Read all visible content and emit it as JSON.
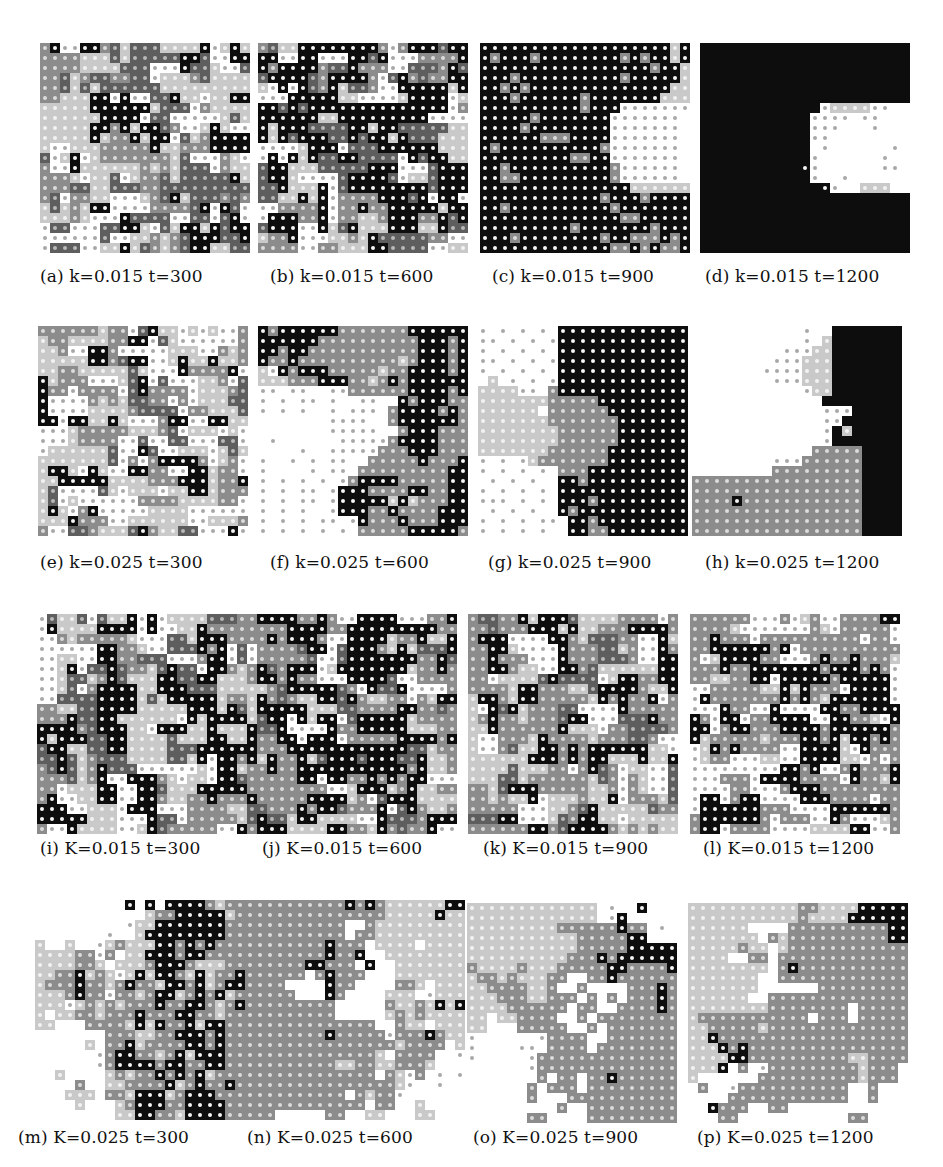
{
  "figure": {
    "cell_size": 10,
    "panels": [
      {
        "id": "a",
        "caption": "(a) k=0.015 t=300",
        "x": 40,
        "y": 43,
        "cols": 21,
        "rows": 21,
        "cap_x": 40,
        "cap_y": 266,
        "seed": 11,
        "mix": "KMDLLo"
      },
      {
        "id": "b",
        "caption": "(b) k=0.015 t=600",
        "x": 258,
        "y": 43,
        "cols": 21,
        "rows": 21,
        "cap_x": 270,
        "cap_y": 266,
        "seed": 23,
        "mix": "KKMDLo"
      },
      {
        "id": "c",
        "caption": "(c) k=0.015 t=900",
        "x": 480,
        "y": 43,
        "cols": 21,
        "rows": 21,
        "cap_x": 492,
        "cap_y": 266,
        "pattern": "c"
      },
      {
        "id": "d",
        "caption": "(d) k=0.015 t=1200",
        "x": 700,
        "y": 43,
        "cols": 21,
        "rows": 21,
        "cap_x": 705,
        "cap_y": 266,
        "pattern": "d"
      },
      {
        "id": "e",
        "caption": "(e) k=0.025 t=300",
        "x": 38,
        "y": 326,
        "cols": 21,
        "rows": 21,
        "cap_x": 40,
        "cap_y": 552,
        "seed": 37,
        "mix": "ooLLMDK"
      },
      {
        "id": "f",
        "caption": "(f) k=0.025 t=600",
        "x": 258,
        "y": 326,
        "cols": 21,
        "rows": 21,
        "cap_x": 270,
        "cap_y": 552,
        "pattern": "f"
      },
      {
        "id": "g",
        "caption": "(g) k=0.025 t=900",
        "x": 478,
        "y": 326,
        "cols": 21,
        "rows": 21,
        "cap_x": 488,
        "cap_y": 552,
        "pattern": "g"
      },
      {
        "id": "h",
        "caption": "(h) k=0.025 t=1200",
        "x": 692,
        "y": 326,
        "cols": 21,
        "rows": 21,
        "cap_x": 705,
        "cap_y": 552,
        "pattern": "h"
      },
      {
        "id": "i",
        "caption": "(i) K=0.015 t=300",
        "x": 37,
        "y": 614,
        "cols": 21,
        "rows": 22,
        "cap_x": 40,
        "cap_y": 838,
        "seed": 51,
        "mix": "KKMDLLo"
      },
      {
        "id": "j",
        "caption": "(j) K=0.015 t=600",
        "x": 247,
        "y": 614,
        "cols": 21,
        "rows": 22,
        "cap_x": 262,
        "cap_y": 838,
        "seed": 67,
        "mix": "KKMMDLo"
      },
      {
        "id": "k",
        "caption": "(k) K=0.015 t=900",
        "x": 468,
        "y": 614,
        "cols": 21,
        "rows": 22,
        "cap_x": 483,
        "cap_y": 838,
        "seed": 79,
        "mix": "KKMMDLLo"
      },
      {
        "id": "l",
        "caption": "(l) K=0.015 t=1200",
        "x": 690,
        "y": 614,
        "cols": 21,
        "rows": 22,
        "cap_x": 703,
        "cap_y": 838,
        "seed": 91,
        "mix": "KKMMMLoo"
      },
      {
        "id": "m",
        "caption": "(m) K=0.025 t=300",
        "x": 35,
        "y": 900,
        "cols": 21,
        "rows": 22,
        "cap_x": 18,
        "cap_y": 1127,
        "pattern": "m"
      },
      {
        "id": "n",
        "caption": "(n) K=0.025 t=600",
        "x": 245,
        "y": 900,
        "cols": 22,
        "rows": 22,
        "cap_x": 247,
        "cap_y": 1127,
        "pattern": "n"
      },
      {
        "id": "o",
        "caption": "(o) K=0.025 t=900",
        "x": 467,
        "y": 903,
        "cols": 21,
        "rows": 22,
        "cap_x": 473,
        "cap_y": 1127,
        "pattern": "o"
      },
      {
        "id": "p",
        "caption": "(p) K=0.025 t=1200",
        "x": 688,
        "y": 903,
        "cols": 21,
        "rows": 22,
        "cap_x": 697,
        "cap_y": 1127,
        "pattern": "p"
      }
    ],
    "patterns": {
      "c": [
        "KKKKKKKKKKKKKKKKKKKLK",
        "KMKKKMKKKKKKKKMKMKKLK",
        "KKKKKKKKKKKKKKKKKMKKL",
        "KKKMKKKKKKKKKKMKKKKKL",
        "KKMKMKKKKKKKKKKKKKKLL",
        "KKKMKKKKKKMKKKKKKKLLL",
        "KKKKKKKKKKMKKKooooooo",
        "KKKKKMKKKKKKKooooooo",
        "KKKKMKKKKKKKKooooooo",
        "KKKKKKMMMKKKKooooooo",
        "KMKKKKKKKKKKMooooooo",
        "KKKKKKKKKMMKKooooooo",
        "KKMKKKKKKKKKKMoooooo",
        "KKMMKKKKKKKKKMoooooo",
        "KKKKKKKKKKKKKKKLLLLLL",
        "KKKKKKKKKKKKMKKKMKKKK",
        "KKMKKKKKKKKKKMKKKKKKK",
        "KKKKKKKKKKKKKKMMKKKKK",
        "KKKKKKKKKMKKKKKKKMKKK",
        "KKKMKKKKKKKKMKKMMMKMK",
        "KKKKKKKKKKKKKMMKMKMMK"
      ],
      "d": [
        "BBBBBBBBBBBBBBBBBBBBB",
        "BBBBBBBBBBBBBBBBBBBBB",
        "BBBBBBBBBBBBBBBBBBBBB",
        "BBBBBBBBBBBBBBBBBBBBB",
        "BBBBBBBBBBBBBBBBBBBBB",
        "BBBBBBBBBBBBBBBBBBBBB",
        "BBBBBBBBBBBBoLLLLooww",
        "BBBBBBBBBBBoooowoowww",
        "BBBBBBBBBBBooowwwowww",
        "BBBBBBBBBBBoowwwwwwww",
        "BBBBBBBBBBBwowwwwwwow",
        "BBBBBBBBBBBowwwwwwoww",
        "BBBBBBBBBBKowwwwwwoow",
        "BBBBBBBBBBBowwowwwwww",
        "BBBBBBBBBBBBKowwLLLww",
        "BBBBBBBBBBBBBBBBBBBBB",
        "BBBBBBBBBBBBBBBBBBBBB",
        "BBBBBBBBBBBBBBBBBBBBB",
        "BBBBBBBBBBBBBBBBBBBBB",
        "BBBBBBBBBBBBBBBBBBBBB",
        "BBBBBBBBBBBBBBBBBBBBB"
      ],
      "f": [
        "KMKKKKKKMMMMMMMKKKKKK",
        "KKKKKKMMMMMMMMMMKKKMK",
        "KKMKKMMMMMMMMMMMKKKMK",
        "KMMKMMMMMMMMMMLMKKKMK",
        "LoKMKKKMMMMMLMMKKKKMK",
        "LLLMMMKKKMMLMKMKKKKKK",
        "oowoowwooMMMMMMKKKKMK",
        "owowoowowwoowwKMKKKMM",
        "owowowwowooowMKKKKMKM",
        "wwwwwwwoooowwMKKKKKKM",
        "wwwwwwwooooowwMKKKMMM",
        "wowwwwwwoooooMKKKKMMM",
        "wwwwowwoooooMMMKKKMMM",
        "owwowowoowwMMMMMKMMMK",
        "owwwwowoowMMMMMMMMMKK",
        "owowowowoMKKKKMMMMMKK",
        "owowoowoKKKMMMMKKMMKK",
        "owowoowoKKKKKLKLMMMKK",
        "owowowwoKKKMMKMMMMKKK",
        "owowowoowoKMMMKMMMKKK",
        "owowowowowMMMMMKKKKKM"
      ],
      "g": [
        "owowowowKKKKKKKKKKKKK",
        "oowowowoKKKKKKKKKKKKK",
        "owowowowKKKKKKKKKKKKK",
        "oowowowoKKKKKKKKKKKKK",
        "owowowowKKKKKKKKKKKKK",
        "wLwowowoKKKKKKKKKKKKK",
        "LLLLoowMKKKKKKKKKKKKK",
        "LLLLLLLMMMMMKKKKKKKKK",
        "LLLLLLwMMMMMMKKKKKKKK",
        "LLLLLLLMMMMMMMKKKKKKK",
        "LLLLLLLLMMMMMMKKKKKKK",
        "LLLLLLLLMMMMMMKKKKKKK",
        "LLLLLLLMMMMMMKKKKKKKK",
        "owowoLMMMMMMMKKKKKKKK",
        "owowowowMMMKKKKKKKKKK",
        "wowowowwKKMKKKKKKKKKK",
        "owowowowKKKKKKKKKKKKK",
        "ooowowowKKKMKKKKKKKKK",
        "wowowowwKMKKKKKKKKKKK",
        "owowowoowKKMKKKKKKKKK",
        "owowowowwKKMMKKKKKKKK"
      ],
      "h": [
        "wwwwwwwwwwwowwBBBBBBB",
        "wwwwwwwwwwwowLBBBBBBB",
        "wwwwwwwwwoooLLBBBBBBB",
        "wwwwwwwwoooLLLBBBBBBB",
        "wwwwwwwooooLLLBBBBBBB",
        "wwwwwwwwoooLLLBBBBBBB",
        "wwwwwwwwwwwoLLBBBBBBB",
        "wwwwwwwwwwwwwBBBBBBBB",
        "wwwwwwwwwwwwwoooBBBBB",
        "wwwwwwwwwwwwwooBBBBBB",
        "wwwwwwwwwwwwwoBLBBBBB",
        "wwwwwwwwwwwwwoBBBBBBB",
        "wwwwwwwwwwwwMMMMMBBBB",
        "wwwwwwwwoooMMMMMMBBBB",
        "wwwwwwwwMMMMMMMMMBBBB",
        "MMMMMMMMMMMMMMMMMBBBB",
        "MMMMMMMMMMMMMMMMMBBBB",
        "MMMMKMMMMMMMMMMMMBBBB",
        "MMMMMMMMMMMMMMMMMBBBB",
        "MMMMMMMMMMMMMMMMMBBBB",
        "MMMMMMMMMMMMMMMMMBBBB"
      ],
      "m": [
        "wwwwwwwwwKwKwKKKKMLMMM",
        "wwwwwwwwwwwLMMKKKKKLMMM",
        "wwwwwwwwwoLLKKKKKKKMMMM",
        "wwwwwwwowwLKKKKKKKKMMMM",
        "LwwLwwoLMLLLKKMKMKMMMMM",
        "LLLLMMoMwLLKKKMKKMMMMMM",
        "LLLLMMLwLLLMKKKMLLLMMMM",
        "LLMMKLMLoLKLKKMLKLMMKKK",
        "LMMMKMMLMKMMLKKMKLMKKKK",
        "LLLMKMMoMMLMKKLMKMKLMMM",
        "LLLoLMLMLMMMKMMKKMLMKMM",
        "LwLLMMLMMMKMMMKKMMLMMMM",
        "LLwwwMMMMLKLKMMKLKKMMMM",
        "wwwwwwwMMMLLMMKKKMKMMMM",
        "wwwwwLwMMKLMMMMKKMKMMMM",
        "wwwwwwoMKKMMLMKLKKKMMMM",
        "wwwwwwoMKKKKMKKMMKKMMMM",
        "wwLwwwwLMLMMKMKMKLMMMMM",
        "wwwwMwwLLMMMMKLMKMMKMMM",
        "wwwLLLwMMLKKKLMKKKMMMMM",
        "wwwwLwwwLMKKKMMKKKKMMMM",
        "wwwwwwwwLLKKMMLKKKKMMwM"
      ],
      "n": [
        "MMMMMMMMMMKMKMLLLLLLKK",
        "MMMMMMMMMMMMMMLLLLLKLL",
        "MMMMMMMMMMwwMLLLLLLLLL",
        "MMMMMMMMMMwMMLLLLLLLLL",
        "MMMMMMMMKMMMwLLLLwLLLL",
        "MMMMMMMMKMMKwwLLLLLLLL",
        "MMMMMMKKMMMwKwwLLLLLLL",
        "MMMMMMwMKMMMwwwLLLLLLL",
        "MMMMwwwwKMMwwwwMMLwLLL",
        "MMMMMwwwKMwwwwLLLwoLLL",
        "MMMMMMMMMwwwwwMLLMLKLK",
        "MMMMMMMMMwwwwwLMLMLLLL",
        "MMMMMMMMMMMMMwwMLLwLLL",
        "MMMMMMMMKMMMMMoMMMKMLL",
        "MMMMMMMMMMMMMMMLMMMMwL",
        "MMMMMMMMMMMMMLwMMMMwwo",
        "MMMMMMMMMLLMMLLMMMLwww",
        "MMMMMMMMMMMMMwMLoMwowo",
        "MMMMMMMMMMMMMMMLowwoww",
        "MMMMMMMMMMwMLMMowwwwww",
        "MMMMMMMMMMMMwMMwwLwwww",
        "MMMwwwwwMMwwLLwwwLLwww"
      ],
      "o": [
        "LLLLLLLLLLLLLwowwKwwww",
        "LLLLLLLLLLLLLwoKwwwwww",
        "LLLLLLLLLMMMMMMKMMwoww",
        "LLLLLLLLLLLMMMMMKKwwww",
        "LLLLLLLLLLLMMMMMKKKKKw",
        "LLLLLLLLLLMMMKMKKKKKKw",
        "MLLLLMLLLMMMMMKKMMMMKw",
        "LMMLMLLLMMwwMMKMMMMMMw",
        "LLMMMMLLMwwMwwwwMMMKMw",
        "LLLMMMLLMMMwMwMwMMMKMw",
        "LLLLMMMMMMwMMwwMMMMKMw",
        "LLwLLMMMMwwMwMMMMMMMMw",
        "LLwwwMMMMMwwMwMMMMMMMw",
        "owwwwwwoMMMMwwMMMMMMMw",
        "owwwwoowMMMMwMMMMMMMMw",
        "owwwwwoMMMMMMMMMMMMMMw",
        "wwwwwwoMMMMMMMMMMMMMMw",
        "wwwwwwwMwMMwMMKMMMMMMw",
        "wwwwwwMwMMMwMMMMMMMMMw",
        "wwwwwwMwwwMMMMMMMMMMMw",
        "wwwwwwwwwMwwMMMMMMMMMw",
        "wwwwwwMMwwwwMMMMMMMMMw"
      ],
      "p": [
        "LLLLLLLLLLLMMLLLLKKKKK",
        "LLLLLLLLLLLMLLLLKKKKKK",
        "LLLLLLwwwwMMMMMMMMMMKK",
        "LLLLLLLwMLMMMMMMMMMMKK",
        "LLLLLMLLwLMMMMMMMMMMMM",
        "LLLLwwMMwMMMMMMMMMMMMM",
        "LLLLLLLLwMKMMMMMMMMMMM",
        "LLLLLLLwwMMMMMMMMMMMMM",
        "LLLLLLLwwwwwwMMMMMMMMM",
        "LLLLLLwwMMMMMMMMMMMMMM",
        "LLLLLLLLMMMMMMMMwMMMMM",
        "LMMMMMMMMMMMwMMMwMMMMM",
        "LLMMMMMLMMMMMMMMMMMMMM",
        "LLKMMMMMMMMMMMMMMMMMMM",
        "LLLKMKMMMMMMMMMMMMMMMM",
        "LLLLKKMMMMMMMMMMLLMMMM",
        "LLLKwMwoMMMMMMMMMLMMMw",
        "LwwwwwwMMMMMMMMMMLMMMw",
        "wMwwoMMMMMMMMMMMwwMwww",
        "wwwwMMMMMMMMMMMMwwMwww",
        "wwKMMMwwMMwwwwwwwwwwww",
        "wwwMMwwwwwwwwwwwMMwwww"
      ]
    }
  }
}
